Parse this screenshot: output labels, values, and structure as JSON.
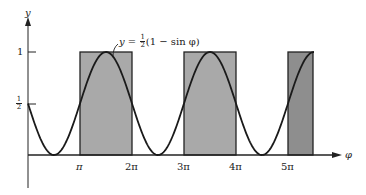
{
  "chart_data": {
    "type": "line",
    "title": "",
    "formula_label": "y = ½(1 − sin φ)",
    "xlabel": "φ",
    "ylabel": "y",
    "x_ticks": [
      "π",
      "2π",
      "3π",
      "4π",
      "5π"
    ],
    "y_ticks": [
      "½",
      "1"
    ],
    "ylim": [
      0,
      1
    ],
    "xlim": [
      0,
      5.5
    ],
    "series": [
      {
        "name": "y = ½(1 − sin φ)",
        "function": "0.5*(1-sin(phi))"
      }
    ],
    "shaded_rectangles": [
      {
        "x_start": "π",
        "x_end": "2π",
        "height": 1
      },
      {
        "x_start": "3π",
        "x_end": "4π",
        "height": 1
      },
      {
        "x_start": "5π",
        "x_end": "5.5π",
        "height": 1
      }
    ],
    "grid": false,
    "legend": "none"
  },
  "labels": {
    "y_axis": "y",
    "x_axis": "φ",
    "formula_prefix": "y = ",
    "formula_num": "1",
    "formula_den": "2",
    "formula_suffix": "(1 − sin φ)",
    "tick_one": "1",
    "tick_half_num": "1",
    "tick_half_den": "2",
    "pi1": "π",
    "pi2": "2π",
    "pi3": "3π",
    "pi4": "4π",
    "pi5": "5π"
  }
}
